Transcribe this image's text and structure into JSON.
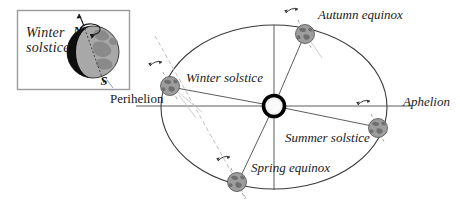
{
  "diagram": {
    "title_inset": "Winter\nsolstice",
    "inset": {
      "title_line1": "Winter",
      "title_line2": "solstice",
      "globe": {
        "north_pole_label": "N",
        "south_pole_label": "S",
        "night_side_color": "#0d0d0d",
        "day_side_color": "#a8a8a8",
        "land_color": "#8a8a8a",
        "rotation_arrow": "curved-arrow-ccw"
      },
      "border_color": "#9a9a9a"
    },
    "orbit": {
      "shape": "ellipse",
      "center": [
        274,
        107
      ],
      "semi_major_px": 113,
      "semi_minor_px": 82,
      "stroke_color": "#3a3a3a"
    },
    "sun": {
      "label": "",
      "center": [
        274,
        106
      ],
      "ring_color": "#000000",
      "core_color": "#f2f2f2",
      "radius_px": 11
    },
    "axis_lines": {
      "horizontal": "major-axis-line",
      "vertical": "minor-axis-line",
      "color": "#4a4a4a",
      "dashed_color": "#b0b0b0"
    },
    "labels": {
      "autumn_equinox": "Autumn equinox",
      "aphelion": "Aphelion",
      "winter_solstice": "Winter solstice",
      "summer_solstice": "Summer solstice",
      "spring_equinox": "Spring equinox",
      "perihelion": "Perihelion"
    },
    "earth_positions": [
      {
        "name": "winter-solstice",
        "center": [
          170,
          86
        ],
        "axis_tilt_deg": -23,
        "rotation_arrow": "curved-arrow-ccw"
      },
      {
        "name": "autumn-equinox",
        "center": [
          305,
          33
        ],
        "axis_tilt_deg": -23,
        "rotation_arrow": "curved-arrow-ccw"
      },
      {
        "name": "summer-solstice",
        "center": [
          378,
          128
        ],
        "axis_tilt_deg": -23,
        "rotation_arrow": "curved-arrow-ccw"
      },
      {
        "name": "spring-equinox",
        "center": [
          237,
          182
        ],
        "axis_tilt_deg": -23,
        "rotation_arrow": "curved-arrow-ccw"
      }
    ],
    "colors": {
      "earth_ocean": "#9d9d9d",
      "earth_land": "#777777",
      "earth_outline": "#4f4f4f",
      "line": "#4a4a4a",
      "text": "#1a1a1a"
    }
  }
}
